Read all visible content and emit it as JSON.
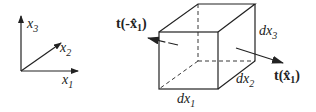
{
  "axes": {
    "x1_label": "x",
    "x1_sub": "1",
    "x2_label": "x",
    "x2_sub": "2",
    "x3_label": "x",
    "x3_sub": "3"
  },
  "cube": {
    "dx1_label": "dx",
    "dx1_sub": "1",
    "dx2_label": "dx",
    "dx2_sub": "2",
    "dx3_label": "dx",
    "dx3_sub": "3"
  },
  "tractions": {
    "neg_label_pre": "t(-",
    "neg_label_x": "x̂",
    "neg_label_sub": "1",
    "neg_label_post": ")",
    "pos_label_pre": "t(",
    "pos_label_x": "x̂",
    "pos_label_sub": "1",
    "pos_label_post": ")"
  },
  "colors": {
    "stroke": "#222222"
  }
}
